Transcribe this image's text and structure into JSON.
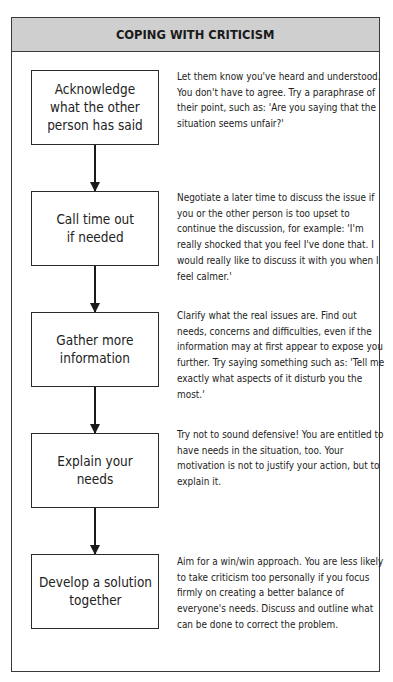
{
  "title": "COPING WITH CRITICISM",
  "colors": {
    "header_bg": "#cfcfcf",
    "border": "#3a3a3a",
    "text": "#222222"
  },
  "steps": [
    {
      "label": "Acknowledge\nwhat the other\nperson has said",
      "description": "Let them know you've heard and understood. You don't have to agree. Try a paraphrase of their point, such as: 'Are you saying that the situation seems unfair?'"
    },
    {
      "label": "Call time out\nif needed",
      "description": "Negotiate a later time to discuss the issue if you or the other person is too upset to continue the discussion, for example: 'I'm really shocked that you feel I've done that. I would really like to discuss it with you when I feel calmer.'"
    },
    {
      "label": "Gather more\ninformation",
      "description": "Clarify what the real issues are. Find out needs, concerns and difficulties, even if the information may at first appear to expose you further. Try saying something such as: 'Tell me exactly what aspects of it disturb you the most.'"
    },
    {
      "label": "Explain your needs",
      "description": "Try not to sound defensive! You are entitled to have needs in the situation, too. Your motivation is not to justify your action, but to explain it."
    },
    {
      "label": "Develop a solution\ntogether",
      "description": "Aim for a win/win approach. You are less likely to take criticism too personally if you focus firmly on creating a better balance of everyone's needs. Discuss and outline what can be done to correct the problem."
    }
  ]
}
